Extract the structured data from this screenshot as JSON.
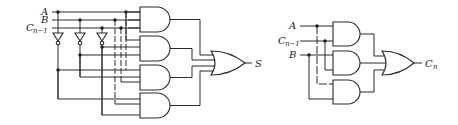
{
  "sum_circuit": {
    "inputs": [
      "A",
      "B",
      "C"
    ],
    "input_c_subscript": "n−1",
    "output": "S",
    "gates": {
      "inverters": 3,
      "and3": 4,
      "or4": 1
    }
  },
  "carry_circuit": {
    "inputs": [
      "A",
      "C",
      "B"
    ],
    "input_c_subscript": "n−1",
    "output": "C",
    "output_subscript": "n",
    "gates": {
      "and2": 3,
      "or3": 1
    }
  },
  "colors": {
    "line": "#2a2a2a",
    "background": "#ffffff"
  }
}
